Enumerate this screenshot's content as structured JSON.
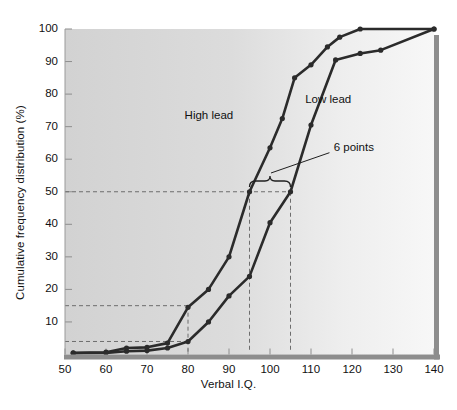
{
  "chart_data": {
    "type": "line",
    "title": "",
    "xlabel": "Verbal I.Q.",
    "ylabel": "Cumulative frequency distribution (%)",
    "xlim": [
      50,
      140
    ],
    "ylim": [
      0,
      100
    ],
    "xticks": [
      50,
      60,
      70,
      80,
      90,
      100,
      110,
      120,
      130,
      140
    ],
    "yticks": [
      10,
      20,
      30,
      40,
      50,
      60,
      70,
      80,
      90,
      100
    ],
    "grid": false,
    "legend_position": "inline-labels",
    "series": [
      {
        "name": "High lead",
        "color": "#2b2b2b",
        "x": [
          52,
          60,
          65,
          70,
          75,
          80,
          85,
          90,
          95,
          100,
          103,
          106,
          110,
          114,
          117,
          122,
          140
        ],
        "y": [
          0.5,
          0.7,
          2.0,
          2.2,
          3.5,
          14.5,
          20.0,
          30.0,
          50.0,
          63.5,
          72.5,
          85.0,
          89.0,
          94.5,
          97.5,
          100.0,
          100.0
        ]
      },
      {
        "name": "Low lead",
        "color": "#2b2b2b",
        "x": [
          52,
          60,
          65,
          70,
          75,
          80,
          85,
          90,
          95,
          100,
          105,
          110,
          116,
          122,
          127,
          140
        ],
        "y": [
          0.4,
          0.5,
          1.0,
          1.2,
          2.0,
          4.0,
          10.0,
          18.0,
          24.0,
          40.5,
          50.0,
          70.5,
          90.5,
          92.5,
          93.5,
          100.0
        ]
      }
    ],
    "annotations": [
      {
        "text": "High lead",
        "x": 86,
        "y": 73
      },
      {
        "text": "Low lead",
        "x": 112,
        "y": 78
      },
      {
        "text": "6 points",
        "x": 117,
        "y": 63
      }
    ],
    "reference_lines": {
      "horizontal": [
        50,
        15,
        4
      ],
      "vertical": [
        80,
        95,
        105
      ],
      "style": "dashed"
    },
    "brace": {
      "label": "6 points",
      "from_x": 95,
      "to_x": 105,
      "at_y": 53
    }
  },
  "axes": {
    "y_title": "Cumulative frequency distribution (%)",
    "x_title": "Verbal I.Q.",
    "y_tick_labels": [
      "100",
      "90",
      "80",
      "70",
      "60",
      "50",
      "40",
      "30",
      "20",
      "10"
    ],
    "x_tick_labels": [
      "50",
      "60",
      "70",
      "80",
      "90",
      "100",
      "110",
      "120",
      "130",
      "140"
    ]
  },
  "labels": {
    "high_lead": "High lead",
    "low_lead": "Low lead",
    "six_points": "6 points"
  },
  "colors": {
    "curve": "#2b2b2b",
    "plot_background_left": "#d3d3d3",
    "plot_background_right": "#f3f3f3",
    "dashed": "#6d6d6d",
    "axis_shadow": "#8a8a8a",
    "text": "#111111"
  }
}
